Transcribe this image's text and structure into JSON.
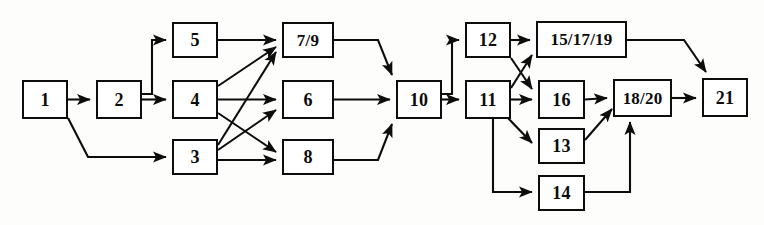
{
  "diagram": {
    "type": "directed-graph",
    "canvas": {
      "width": 764,
      "height": 225
    },
    "style": {
      "background": "#fdfdfb",
      "node_fill": "#ffffff",
      "node_stroke": "#0d0d0d",
      "edge_color": "#0d0d0d",
      "text_color": "#0b0b0b"
    },
    "nodes": [
      {
        "id": "n1",
        "label": "1",
        "x": 22,
        "y": 80,
        "w": 46,
        "h": 39,
        "size": "sm"
      },
      {
        "id": "n2",
        "label": "2",
        "x": 96,
        "y": 80,
        "w": 46,
        "h": 39,
        "size": "sm"
      },
      {
        "id": "n5",
        "label": "5",
        "x": 172,
        "y": 22,
        "w": 46,
        "h": 36,
        "size": "sm"
      },
      {
        "id": "n4",
        "label": "4",
        "x": 172,
        "y": 80,
        "w": 46,
        "h": 39,
        "size": "sm"
      },
      {
        "id": "n3",
        "label": "3",
        "x": 172,
        "y": 139,
        "w": 46,
        "h": 36,
        "size": "sm"
      },
      {
        "id": "n79",
        "label": "7/9",
        "x": 282,
        "y": 22,
        "w": 52,
        "h": 36,
        "size": "md"
      },
      {
        "id": "n6",
        "label": "6",
        "x": 282,
        "y": 80,
        "w": 52,
        "h": 39,
        "size": "sm"
      },
      {
        "id": "n8",
        "label": "8",
        "x": 282,
        "y": 139,
        "w": 52,
        "h": 36,
        "size": "sm"
      },
      {
        "id": "n10",
        "label": "10",
        "x": 396,
        "y": 80,
        "w": 46,
        "h": 39,
        "size": "sm"
      },
      {
        "id": "n12",
        "label": "12",
        "x": 465,
        "y": 22,
        "w": 46,
        "h": 36,
        "size": "sm"
      },
      {
        "id": "n11",
        "label": "11",
        "x": 465,
        "y": 80,
        "w": 46,
        "h": 39,
        "size": "sm"
      },
      {
        "id": "n151719",
        "label": "15/17/19",
        "x": 536,
        "y": 21,
        "w": 91,
        "h": 37,
        "size": "lg"
      },
      {
        "id": "n16",
        "label": "16",
        "x": 538,
        "y": 80,
        "w": 47,
        "h": 39,
        "size": "sm"
      },
      {
        "id": "n13",
        "label": "13",
        "x": 538,
        "y": 128,
        "w": 47,
        "h": 36,
        "size": "sm"
      },
      {
        "id": "n14",
        "label": "14",
        "x": 538,
        "y": 175,
        "w": 47,
        "h": 36,
        "size": "sm"
      },
      {
        "id": "n1820",
        "label": "18/20",
        "x": 613,
        "y": 79,
        "w": 59,
        "h": 38,
        "size": "md"
      },
      {
        "id": "n21",
        "label": "21",
        "x": 702,
        "y": 78,
        "w": 46,
        "h": 39,
        "size": "sm"
      }
    ],
    "edges": [
      {
        "from": "1",
        "to": "2",
        "name": "edge-1-2"
      },
      {
        "from": "1",
        "to": "3",
        "name": "edge-1-3"
      },
      {
        "from": "2",
        "to": "5",
        "name": "edge-2-5"
      },
      {
        "from": "2",
        "to": "4",
        "name": "edge-2-4"
      },
      {
        "from": "5",
        "to": "7/9",
        "name": "edge-5-79"
      },
      {
        "from": "4",
        "to": "7/9",
        "name": "edge-4-79"
      },
      {
        "from": "4",
        "to": "6",
        "name": "edge-4-6"
      },
      {
        "from": "4",
        "to": "8",
        "name": "edge-4-8"
      },
      {
        "from": "3",
        "to": "7/9",
        "name": "edge-3-79"
      },
      {
        "from": "3",
        "to": "6",
        "name": "edge-3-6"
      },
      {
        "from": "3",
        "to": "8",
        "name": "edge-3-8"
      },
      {
        "from": "7/9",
        "to": "10",
        "name": "edge-79-10"
      },
      {
        "from": "6",
        "to": "10",
        "name": "edge-6-10"
      },
      {
        "from": "8",
        "to": "10",
        "name": "edge-8-10"
      },
      {
        "from": "10",
        "to": "12",
        "name": "edge-10-12"
      },
      {
        "from": "10",
        "to": "11",
        "name": "edge-10-11"
      },
      {
        "from": "12",
        "to": "15/17/19",
        "name": "edge-12-151719"
      },
      {
        "from": "12",
        "to": "16",
        "name": "edge-12-16"
      },
      {
        "from": "11",
        "to": "15/17/19",
        "name": "edge-11-151719"
      },
      {
        "from": "11",
        "to": "16",
        "name": "edge-11-16"
      },
      {
        "from": "11",
        "to": "13",
        "name": "edge-11-13"
      },
      {
        "from": "11",
        "to": "14",
        "name": "edge-11-14"
      },
      {
        "from": "15/17/19",
        "to": "21",
        "name": "edge-151719-21"
      },
      {
        "from": "16",
        "to": "18/20",
        "name": "edge-16-1820"
      },
      {
        "from": "13",
        "to": "18/20",
        "name": "edge-13-1820"
      },
      {
        "from": "14",
        "to": "18/20",
        "name": "edge-14-1820"
      },
      {
        "from": "18/20",
        "to": "21",
        "name": "edge-1820-21"
      }
    ]
  }
}
